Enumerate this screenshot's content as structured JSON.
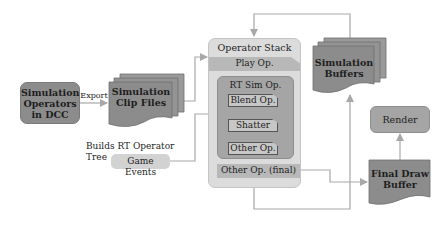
{
  "nodes": {
    "sim_operators": {
      "label_line1": "Simulation",
      "label_line2": "Operators",
      "label_line3": "in DCC"
    },
    "export_label": "Export",
    "clip_files": {
      "label_line1": "Simulation",
      "label_line2": "Clip Files"
    },
    "builds_label": "Builds RT Operator Tree",
    "game_events": "Game Events",
    "operator_stack": {
      "title": "Operator Stack",
      "play_op": "Play Op.",
      "rt_sim_op": {
        "title": "RT Sim Op.",
        "children": [
          "Blend Op.",
          "Shatter Op.",
          "Other Op."
        ]
      },
      "final_op": "Other Op. (final)"
    },
    "sim_buffers": {
      "label_line1": "Simulation",
      "label_line2": "Buffers"
    },
    "render": "Render",
    "final_draw_buffer": {
      "label_line1": "Final Draw",
      "label_line2": "Buffer"
    }
  },
  "colors": {
    "dark_fill": "#8c8c8c",
    "mid_fill": "#a5a5a5",
    "stack_fill": "#dcdcdc",
    "band_fill": "#b8b8b8",
    "line": "#a8a8a8"
  }
}
